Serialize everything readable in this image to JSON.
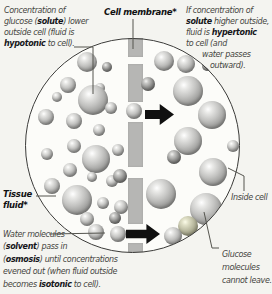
{
  "figure": {
    "title_semantic": "Osmosis across a cell membrane",
    "colors": {
      "page_bg": "#f4f4f0",
      "cell_fill": "#fcfcf9",
      "membrane": "#b6b6b4",
      "arrow": "#101010",
      "text": "#45453f",
      "text_bold": "#16161a",
      "outline": "#3a3a38",
      "leader": "#55554f"
    },
    "captions": {
      "top_left": [
        [
          {
            "t": "Concentration of"
          }
        ],
        [
          {
            "t": "glucose ("
          },
          {
            "t": "solute",
            "b": true
          },
          {
            "t": ") lower"
          }
        ],
        [
          {
            "t": "outside cell (fluid is"
          }
        ],
        [
          {
            "t": "hypotonic",
            "b": true
          },
          {
            "t": " to cell)."
          }
        ]
      ],
      "top_right": [
        [
          {
            "t": "If concentration of"
          }
        ],
        [
          {
            "t": "solute",
            "b": true
          },
          {
            "t": " higher outside,"
          }
        ],
        [
          {
            "t": "fluid is "
          },
          {
            "t": "hypertonic",
            "b": true
          }
        ],
        [
          {
            "t": "to cell (and"
          }
        ],
        [
          {
            "t": "water passes"
          }
        ],
        [
          {
            "t": "outward)."
          }
        ]
      ],
      "bottom_left": [
        [
          {
            "t": "Water molecules"
          }
        ],
        [
          {
            "t": "("
          },
          {
            "t": "solvent",
            "b": true
          },
          {
            "t": ") pass in"
          }
        ],
        [
          {
            "t": "("
          },
          {
            "t": "osmosis",
            "b": true
          },
          {
            "t": ") until concentrations"
          }
        ],
        [
          {
            "t": "evened out (when fluid outside"
          }
        ],
        [
          {
            "t": "becomes "
          },
          {
            "t": "isotonic",
            "b": true
          },
          {
            "t": " to cell)."
          }
        ]
      ],
      "glucose_note": [
        [
          {
            "t": "Glucose"
          }
        ],
        [
          {
            "t": "molecules"
          }
        ],
        [
          {
            "t": "cannot leave."
          }
        ]
      ]
    },
    "labels": {
      "membrane": "Cell membrane*",
      "tissue_line1": "Tissue",
      "tissue_line2": "fluid*",
      "inside_cell": "Inside cell"
    },
    "membrane": {
      "x": 128,
      "width": 15,
      "segments": [
        [
          38,
          57
        ],
        [
          64,
          102
        ],
        [
          122,
          167
        ],
        [
          178,
          224
        ],
        [
          243,
          252
        ]
      ]
    },
    "arrows": [
      {
        "name": "water-flow-arrow-top",
        "x": 145,
        "y": 104,
        "length": 29,
        "height": 21
      },
      {
        "name": "water-flow-arrow-bottom",
        "x": 126,
        "y": 224,
        "length": 34,
        "height": 20
      }
    ],
    "molecules": {
      "outside": [
        {
          "x": 87,
          "y": 62,
          "r": 10
        },
        {
          "x": 107,
          "y": 67,
          "r": 5,
          "shade": "dark"
        },
        {
          "x": 68,
          "y": 85,
          "r": 8
        },
        {
          "x": 57,
          "y": 97,
          "r": 5
        },
        {
          "x": 100,
          "y": 88,
          "r": 5
        },
        {
          "x": 93,
          "y": 100,
          "r": 15
        },
        {
          "x": 111,
          "y": 108,
          "r": 6
        },
        {
          "x": 46,
          "y": 117,
          "r": 8
        },
        {
          "x": 74,
          "y": 121,
          "r": 8
        },
        {
          "x": 99,
          "y": 130,
          "r": 6
        },
        {
          "x": 118,
          "y": 150,
          "r": 6
        },
        {
          "x": 74,
          "y": 146,
          "r": 7
        },
        {
          "x": 47,
          "y": 154,
          "r": 6
        },
        {
          "x": 96,
          "y": 159,
          "r": 14
        },
        {
          "x": 70,
          "y": 170,
          "r": 7
        },
        {
          "x": 92,
          "y": 177,
          "r": 5
        },
        {
          "x": 112,
          "y": 181,
          "r": 6
        },
        {
          "x": 120,
          "y": 176,
          "r": 7,
          "shade": "dark"
        },
        {
          "x": 52,
          "y": 186,
          "r": 8
        },
        {
          "x": 77,
          "y": 200,
          "r": 15
        },
        {
          "x": 103,
          "y": 203,
          "r": 6
        },
        {
          "x": 121,
          "y": 207,
          "r": 7
        },
        {
          "x": 87,
          "y": 219,
          "r": 7
        },
        {
          "x": 115,
          "y": 218,
          "r": 6,
          "shade": "dark"
        },
        {
          "x": 96,
          "y": 232,
          "r": 8
        }
      ],
      "inside": [
        {
          "x": 164,
          "y": 61,
          "r": 10
        },
        {
          "x": 186,
          "y": 64,
          "r": 9
        },
        {
          "x": 207,
          "y": 66,
          "r": 5,
          "shade": "dark"
        },
        {
          "x": 148,
          "y": 84,
          "r": 7,
          "shade": "dark"
        },
        {
          "x": 188,
          "y": 91,
          "r": 15
        },
        {
          "x": 212,
          "y": 115,
          "r": 14
        },
        {
          "x": 233,
          "y": 146,
          "r": 6
        },
        {
          "x": 188,
          "y": 141,
          "r": 14
        },
        {
          "x": 174,
          "y": 157,
          "r": 7,
          "shade": "dark"
        },
        {
          "x": 213,
          "y": 172,
          "r": 14
        },
        {
          "x": 161,
          "y": 194,
          "r": 15
        },
        {
          "x": 206,
          "y": 209,
          "r": 16
        },
        {
          "x": 188,
          "y": 226,
          "r": 10,
          "shade": "tint"
        },
        {
          "x": 173,
          "y": 236,
          "r": 9
        }
      ],
      "in_pore": [
        {
          "x": 134,
          "y": 111,
          "r": 8
        },
        {
          "x": 118,
          "y": 234,
          "r": 8
        }
      ]
    }
  }
}
